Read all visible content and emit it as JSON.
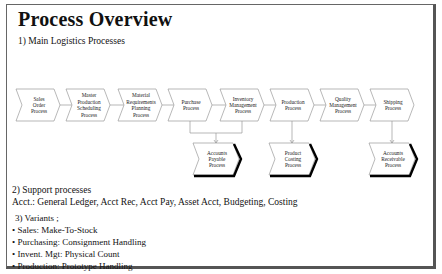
{
  "title": "Process Overview",
  "section1": {
    "heading": "1) Main Logistics Processes"
  },
  "main_processes": [
    {
      "id": "sales",
      "lines": [
        "Sales",
        "Order",
        "Process"
      ]
    },
    {
      "id": "mps",
      "lines": [
        "Master",
        "Production",
        "Scheduling",
        "Process"
      ]
    },
    {
      "id": "mrp",
      "lines": [
        "Material",
        "Requirements",
        "Planning",
        "Process"
      ]
    },
    {
      "id": "purchase",
      "lines": [
        "Purchase",
        "Process"
      ]
    },
    {
      "id": "inventory",
      "lines": [
        "Inventory",
        "Management",
        "Process"
      ]
    },
    {
      "id": "production",
      "lines": [
        "Production",
        "Process"
      ]
    },
    {
      "id": "quality",
      "lines": [
        "Quality",
        "Management",
        "Process"
      ]
    },
    {
      "id": "shipping",
      "lines": [
        "Shipping",
        "Process"
      ]
    }
  ],
  "sub_processes": [
    {
      "id": "ap",
      "lines": [
        "Accounts",
        "Payable",
        "Process"
      ],
      "from": [
        "purchase",
        "inventory"
      ]
    },
    {
      "id": "pc",
      "lines": [
        "Product",
        "Costing",
        "Process"
      ],
      "from": [
        "production"
      ]
    },
    {
      "id": "ar",
      "lines": [
        "Accounts",
        "Receivable",
        "Process"
      ],
      "from": [
        "shipping"
      ]
    }
  ],
  "section2": {
    "heading": "2) Support processes",
    "text": "Acct.: General Ledger, Acct Rec, Acct Pay, Asset Acct, Budgeting, Costing"
  },
  "section3": {
    "heading": "3) Variants  ;",
    "items": [
      "Sales: Make-To-Stock",
      "Purchasing: Consignment Handling",
      "Invent. Mgt: Physical Count",
      "Production: Prototype Handling"
    ]
  }
}
